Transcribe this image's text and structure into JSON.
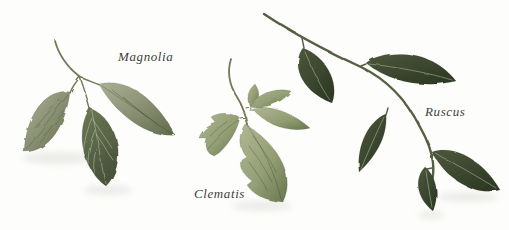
{
  "figure": {
    "labels": {
      "magnolia": "Magnolia",
      "clematis": "Clematis",
      "ruscus": "Ruscus"
    },
    "colors": {
      "background": "#fdfdfb",
      "label_text": "#3f3e3a",
      "magnolia_leaf_light": "#a9b095",
      "magnolia_leaf": "#8a9173",
      "magnolia_leaf_dark": "#606b4c",
      "magnolia_front_leaf": "#6f7957",
      "magnolia_front_leaf_dark": "#47533a",
      "clematis_leaf_light": "#afb793",
      "clematis_leaf": "#939e74",
      "clematis_leaf_dark": "#68754e",
      "ruscus_leaf": "#4d583c",
      "ruscus_leaf_dark": "#2d3923",
      "stem": "#75795b",
      "ruscus_stem": "#555e43",
      "shadow": "#8f958a"
    }
  }
}
